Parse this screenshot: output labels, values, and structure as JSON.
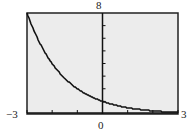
{
  "chart_data": {
    "type": "line",
    "title": "",
    "xlabel": "",
    "ylabel": "",
    "xlim": [
      -3,
      3
    ],
    "ylim": [
      0,
      8
    ],
    "function": "y = (1/2)^x",
    "x": [
      -3,
      -2.5,
      -2,
      -1.5,
      -1,
      -0.5,
      0,
      0.5,
      1,
      1.5,
      2,
      2.5,
      3
    ],
    "series": [
      {
        "name": "y=(1/2)^x",
        "values": [
          8,
          5.66,
          4,
          2.83,
          2,
          1.41,
          1,
          0.71,
          0.5,
          0.35,
          0.25,
          0.18,
          0.125
        ]
      }
    ],
    "x_ticks_step": 1,
    "y_ticks_step": 1,
    "grid": false,
    "legend": "none"
  },
  "labels": {
    "ymax": "8",
    "xmin": "−3",
    "xmax": "3",
    "origin": "0"
  },
  "colors": {
    "screen_bg": "#ececec",
    "frame": "#222222",
    "curve": "#111111"
  }
}
